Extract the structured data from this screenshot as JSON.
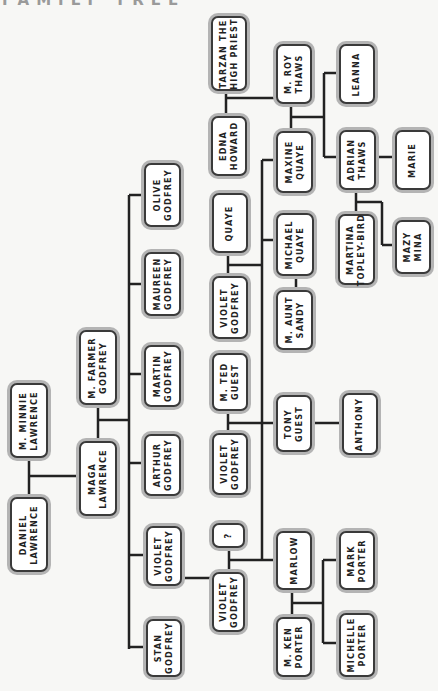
{
  "title": "FAMILY TREE",
  "colors": {
    "line": "#222222",
    "node_border": "#3a3a3a",
    "node_halo": "#b4b4b4",
    "node_fill": "#ffffff",
    "background": "#f7f7f5"
  },
  "nodes": {
    "minnie": {
      "label": "M. MINNIE\nLAWRENCE"
    },
    "daniel": {
      "label": "DANIEL\nLAWRENCE"
    },
    "maga": {
      "label": "MAGA\nLAWRENCE"
    },
    "farmer": {
      "label": "M. FARMER\nGODFREY"
    },
    "olive": {
      "label": "OLIVE\nGODFREY"
    },
    "maureen": {
      "label": "MAUREEN\nGODFREY"
    },
    "martin": {
      "label": "MARTIN\nGODFREY"
    },
    "arthur": {
      "label": "ARTHUR\nGODFREY"
    },
    "violet1": {
      "label": "VIOLET\nGODFREY"
    },
    "stan": {
      "label": "STAN\nGODFREY"
    },
    "unknown": {
      "label": "?"
    },
    "violet2": {
      "label": "VIOLET\nGODFREY"
    },
    "marlow": {
      "label": "MARLOW"
    },
    "ken": {
      "label": "M. KEN\nPORTER"
    },
    "mark": {
      "label": "MARK\nPORTER"
    },
    "michelle": {
      "label": "MICHELLE\nPORTER"
    },
    "ted": {
      "label": "M. TED\nGUEST"
    },
    "violet3": {
      "label": "VIOLET\nGODFREY"
    },
    "tony": {
      "label": "TONY\nGUEST"
    },
    "anthony": {
      "label": "ANTHONY"
    },
    "quaye": {
      "label": "QUAYE"
    },
    "violet4": {
      "label": "VIOLET\nGODFREY"
    },
    "michael": {
      "label": "MICHAEL\nQUAYE"
    },
    "sandy": {
      "label": "M. AUNT\nSANDY"
    },
    "maxine": {
      "label": "MAXINE\nQUAYE"
    },
    "edna": {
      "label": "EDNA\nHOWARD"
    },
    "tarzan": {
      "label": "TARZAN THE\nHIGH PRIEST"
    },
    "roy": {
      "label": "M. ROY\nTHAWS"
    },
    "leanna": {
      "label": "LEANNA"
    },
    "adrian": {
      "label": "ADRIAN\nTHAWS"
    },
    "marie": {
      "label": "MARIE"
    },
    "martina": {
      "label": "MARTINA\nTOPLEY-BIRD"
    },
    "mazy": {
      "label": "MAZY\nMINA"
    }
  }
}
